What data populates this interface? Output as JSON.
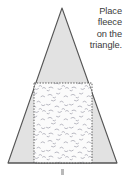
{
  "figure": {
    "background_color": "#ffffff",
    "instruction": {
      "name": "instruction-caption",
      "lines": [
        "Place",
        "fleece",
        "on the",
        "triangle."
      ],
      "full_text": "Place fleece on the triangle.",
      "align": "right",
      "color": "#3b3b3b"
    },
    "triangle": {
      "name": "triangle-shape",
      "fill_color": "#e2e2e2",
      "stroke_color": "#555555",
      "apex": {
        "x": 62,
        "y": 8
      },
      "base_left": {
        "x": 8,
        "y": 163
      },
      "base_right": {
        "x": 117,
        "y": 163
      }
    },
    "fleece_region": {
      "name": "fleece-rectangle",
      "label": "fleece",
      "border_style": "dashed",
      "border_color": "#4a4a4a",
      "fill_color": "#fbfbfb",
      "texture": "speckled-dashes",
      "texture_color": "#a9a9b4",
      "x": 34,
      "y": 83,
      "width": 58,
      "height": 80
    },
    "caption_mark": {
      "name": "figure-caption-mark",
      "color": "#b9b9b9"
    }
  }
}
